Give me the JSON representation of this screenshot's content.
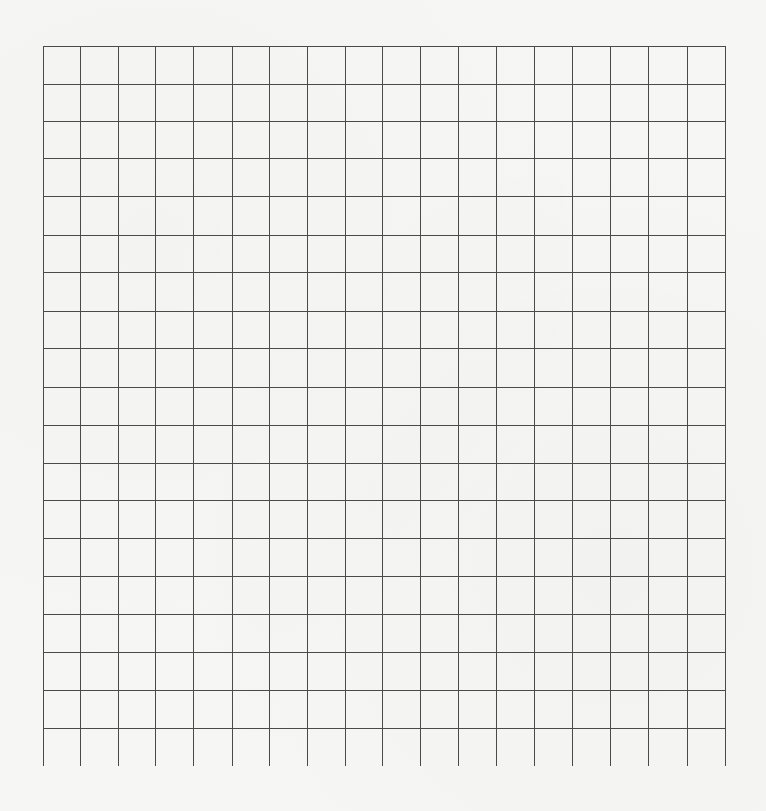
{
  "page": {
    "type": "graph-paper",
    "background_color": "#f6f6f4",
    "line_color": "#4a4a4a"
  },
  "grid": {
    "left": 43,
    "top": 46,
    "columns": 18,
    "rows": 18,
    "cell_size": 37.9,
    "vertical_line_bottom": 766,
    "vertical_lines_x": [
      43,
      80,
      118,
      155,
      193,
      232,
      269,
      307,
      345,
      382,
      420,
      458,
      496,
      534,
      572,
      610,
      648,
      687,
      725
    ],
    "horizontal_lines_y": [
      46,
      84,
      121,
      158,
      196,
      235,
      272,
      311,
      348,
      387,
      425,
      463,
      500,
      538,
      576,
      614,
      652,
      690,
      728
    ]
  }
}
